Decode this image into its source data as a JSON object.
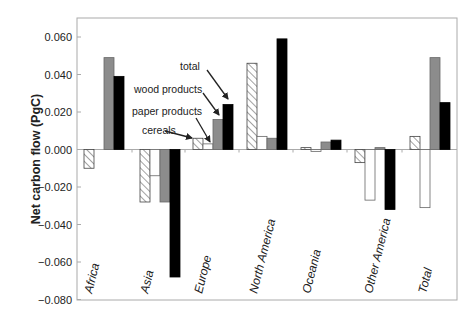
{
  "chart_data": {
    "type": "bar",
    "title": "",
    "xlabel": "",
    "ylabel": "Net carbon flow (PgC)",
    "ylim": [
      -0.08,
      0.07
    ],
    "yticks": [
      0.06,
      0.04,
      0.02,
      0.0,
      -0.02,
      -0.04,
      -0.06,
      -0.08
    ],
    "ytick_labels": [
      "0.060",
      "0.040",
      "0.020",
      "0.000",
      "−0.020",
      "−0.040",
      "−0.060",
      "−0.080"
    ],
    "grid": false,
    "legend_position": "annotations with arrows (Europe group)",
    "categories": [
      "Africa",
      "Asia",
      "Europe",
      "North America",
      "Oceania",
      "Other America",
      "Total"
    ],
    "series": [
      {
        "name": "cereals",
        "style": "hatched",
        "values": [
          -0.01,
          -0.028,
          0.006,
          0.046,
          0.001,
          -0.007,
          0.007
        ]
      },
      {
        "name": "paper products",
        "style": "white",
        "values": [
          0.0,
          -0.014,
          0.003,
          0.007,
          -0.001,
          -0.027,
          -0.031
        ]
      },
      {
        "name": "wood products",
        "style": "gray",
        "values": [
          0.049,
          -0.028,
          0.016,
          0.006,
          0.004,
          0.001,
          0.049
        ]
      },
      {
        "name": "total",
        "style": "black",
        "values": [
          0.039,
          -0.068,
          0.024,
          0.059,
          0.005,
          -0.032,
          0.025
        ]
      }
    ],
    "annotations": [
      "total",
      "wood products",
      "paper products",
      "cereals"
    ],
    "colors": {
      "cereals": "#ffffff",
      "paper products": "#ffffff",
      "wood products": "#8c8c8c",
      "total": "#000000",
      "hatch": "#555555",
      "frame": "#aaaaaa"
    }
  }
}
